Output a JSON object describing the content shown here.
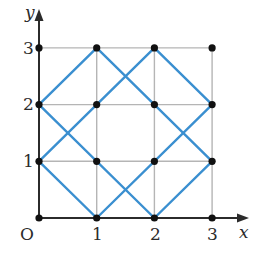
{
  "diagram": {
    "origin_label": "O",
    "x_axis_label": "x",
    "y_axis_label": "y",
    "x_ticks": [
      "1",
      "2",
      "3"
    ],
    "y_ticks": [
      "1",
      "2",
      "3"
    ],
    "grid": {
      "x_min": 0,
      "x_max": 3,
      "y_min": 0,
      "y_max": 3
    },
    "colors": {
      "axis": "#2b2b2b",
      "grid": "#b5b5b5",
      "path": "#3a8fd0",
      "point": "#111111"
    },
    "points": [
      [
        0,
        0
      ],
      [
        1,
        0
      ],
      [
        2,
        0
      ],
      [
        3,
        0
      ],
      [
        0,
        1
      ],
      [
        1,
        1
      ],
      [
        2,
        1
      ],
      [
        3,
        1
      ],
      [
        0,
        2
      ],
      [
        1,
        2
      ],
      [
        2,
        2
      ],
      [
        3,
        2
      ],
      [
        0,
        3
      ],
      [
        1,
        3
      ],
      [
        2,
        3
      ],
      [
        3,
        3
      ]
    ],
    "segments": [
      [
        [
          0,
          2
        ],
        [
          1,
          3
        ]
      ],
      [
        [
          1,
          3
        ],
        [
          3,
          1
        ]
      ],
      [
        [
          0,
          1
        ],
        [
          2,
          3
        ]
      ],
      [
        [
          2,
          3
        ],
        [
          3,
          2
        ]
      ],
      [
        [
          0,
          2
        ],
        [
          2,
          0
        ]
      ],
      [
        [
          0,
          1
        ],
        [
          1,
          0
        ]
      ],
      [
        [
          1,
          0
        ],
        [
          3,
          2
        ]
      ],
      [
        [
          2,
          0
        ],
        [
          3,
          1
        ]
      ]
    ]
  }
}
